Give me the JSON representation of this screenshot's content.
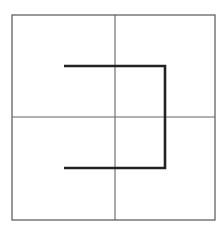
{
  "diagram": {
    "canvas": {
      "width": 220,
      "height": 233
    },
    "frame": {
      "x1": 12,
      "y1": 15,
      "x2": 215,
      "y2": 220,
      "color": "#555555",
      "stroke_width": 1.2
    },
    "divider_vertical": {
      "x": 115,
      "y1": 15,
      "y2": 220,
      "color": "#555555",
      "stroke_width": 1
    },
    "divider_horizontal": {
      "y": 117,
      "x1": 12,
      "x2": 215,
      "color": "#666666",
      "stroke_width": 1
    },
    "path": {
      "points": [
        [
          64,
          66
        ],
        [
          165,
          66
        ],
        [
          165,
          168
        ],
        [
          64,
          168
        ]
      ],
      "color": "#222222",
      "stroke_width": 2.6
    }
  }
}
